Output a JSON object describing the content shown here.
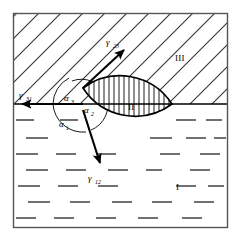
{
  "figure": {
    "frame_color": "#000000",
    "line_color": "#000000",
    "background_color": "#ffffff"
  },
  "regions": [
    {
      "key": "I",
      "label": "I",
      "description": "lower phase, horizontal dashed fill",
      "fill_style": "dashes"
    },
    {
      "key": "II",
      "label": "II",
      "description": "lens-shaped inclusion, vertical hatch fill",
      "fill_style": "vertical-hatch"
    },
    {
      "key": "III",
      "label": "III",
      "description": "upper phase, diagonal hatch fill",
      "fill_style": "diagonal-hatch"
    }
  ],
  "tensions": [
    {
      "key": "gamma_23",
      "symbol": "γ",
      "subscript": "23",
      "direction": "up-right",
      "description": "interfacial tension between phase 2 and phase 3"
    },
    {
      "key": "gamma_31",
      "symbol": "γ",
      "subscript": "31",
      "direction": "left",
      "description": "interfacial tension between phase 3 and phase 1"
    },
    {
      "key": "gamma_12",
      "symbol": "γ",
      "subscript": "12",
      "direction": "down-right",
      "description": "interfacial tension between phase 1 and phase 2"
    }
  ],
  "angles": [
    {
      "key": "alpha_1",
      "symbol": "α",
      "subscript": "1",
      "description": "contact angle in phase I, below the interface"
    },
    {
      "key": "alpha_2",
      "symbol": "α",
      "subscript": "2",
      "description": "contact angle inside the lens, phase II"
    },
    {
      "key": "alpha_3",
      "symbol": "α",
      "subscript": "3",
      "description": "contact angle in phase III, above the interface"
    }
  ]
}
